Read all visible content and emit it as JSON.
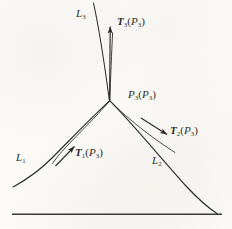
{
  "figure": {
    "background_color": "#fbfaf7",
    "ink_color": "#2c2a28",
    "curves": [
      {
        "name": "upper-curve",
        "label_symbol": "L",
        "label_subscript": "3",
        "label_x": 76,
        "label_y": 8
      },
      {
        "name": "left-curve",
        "label_symbol": "L",
        "label_subscript": "1",
        "label_x": 16,
        "label_y": 152
      },
      {
        "name": "right-curve",
        "label_symbol": "L",
        "label_subscript": "2",
        "label_x": 152,
        "label_y": 155
      }
    ],
    "junction": {
      "name": "junction-point",
      "symbol": "P",
      "subscript": "3",
      "arg_symbol": "P",
      "arg_subscript": "3",
      "label_x": 128,
      "label_y": 89,
      "x": 110,
      "y": 101
    },
    "vectors": [
      {
        "name": "tangent-vector-up",
        "symbol": "T",
        "subscript": "3",
        "arg_symbol": "P",
        "arg_subscript": "3",
        "label_x": 117,
        "label_y": 16
      },
      {
        "name": "tangent-vector-left",
        "symbol": "T",
        "subscript": "1",
        "arg_symbol": "P",
        "arg_subscript": "3",
        "label_x": 75,
        "label_y": 147
      },
      {
        "name": "tangent-vector-right",
        "symbol": "T",
        "subscript": "2",
        "arg_symbol": "P",
        "arg_subscript": "3",
        "label_x": 170,
        "label_y": 125
      }
    ],
    "baseline": {
      "name": "ground-line",
      "x1": 12,
      "y1": 214,
      "x2": 222,
      "y2": 214
    }
  }
}
